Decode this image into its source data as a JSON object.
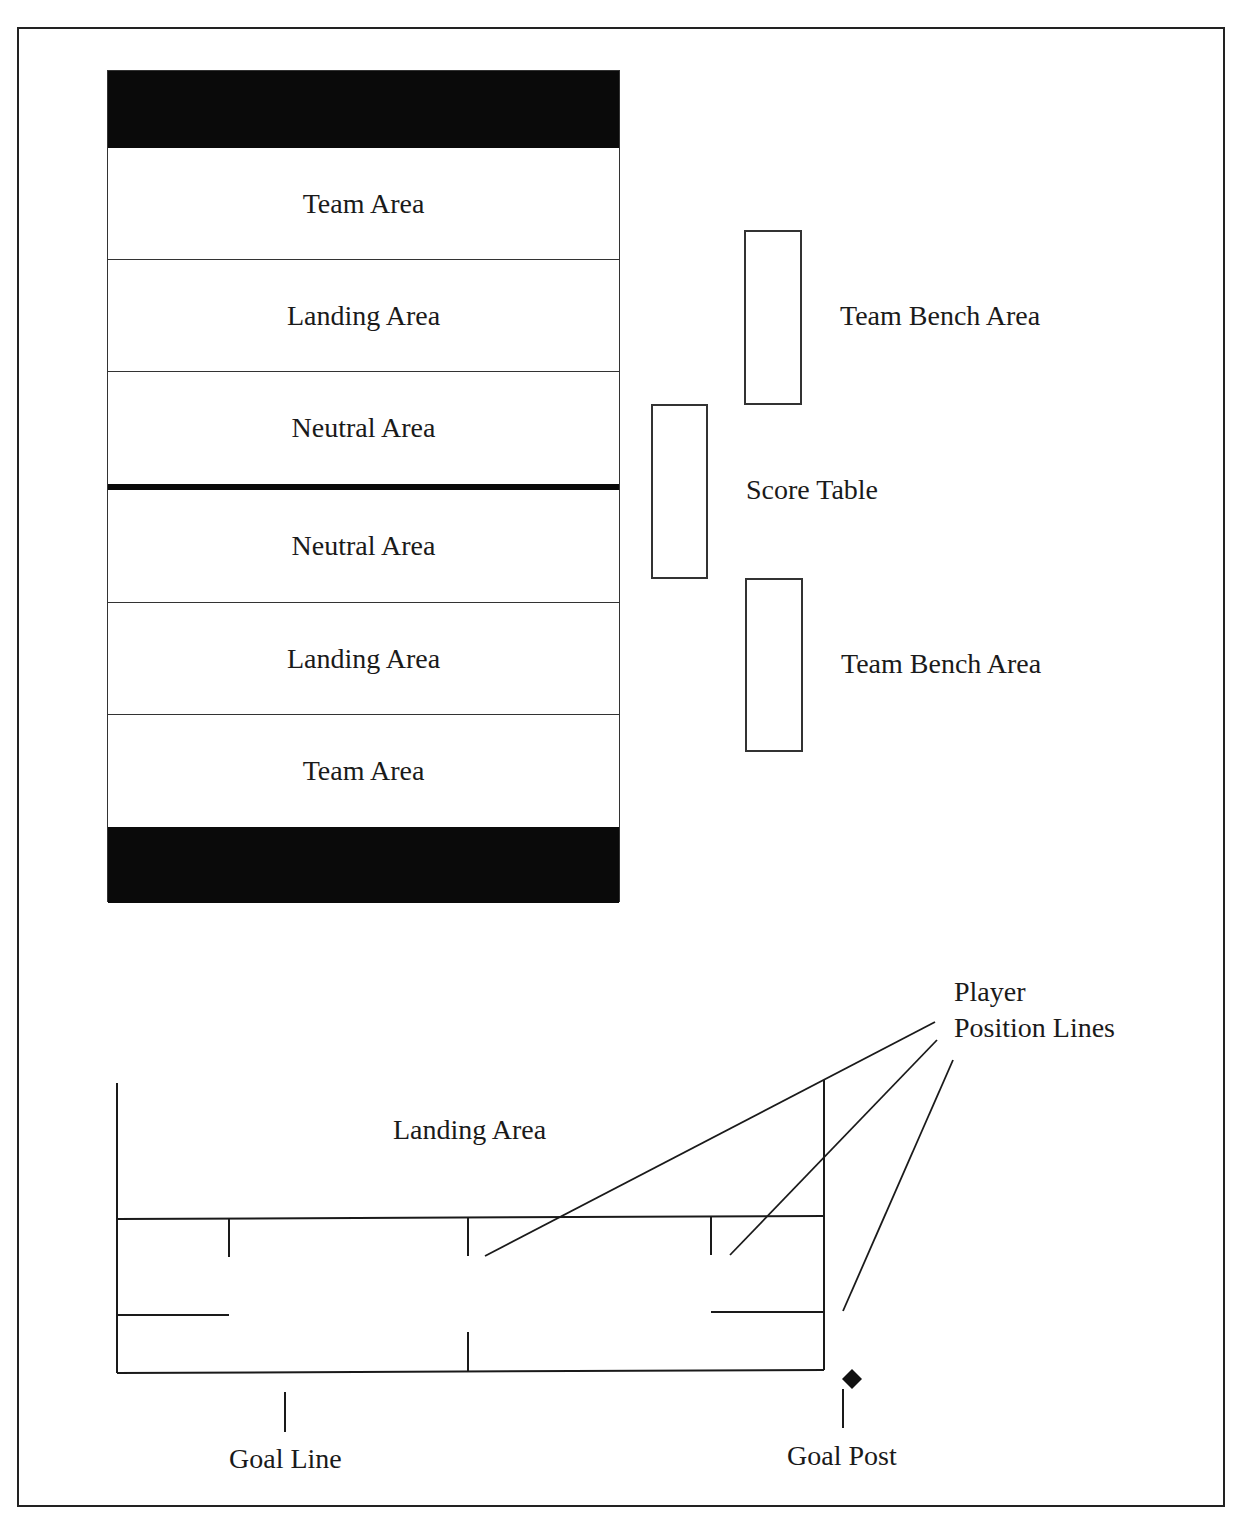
{
  "court": {
    "zones": [
      {
        "label": "Team Area"
      },
      {
        "label": "Landing Area"
      },
      {
        "label": "Neutral Area"
      },
      {
        "label": "Neutral Area"
      },
      {
        "label": "Landing Area"
      },
      {
        "label": "Team Area"
      }
    ]
  },
  "sideline": {
    "bench_top_label": "Team Bench Area",
    "score_table_label": "Score Table",
    "bench_bottom_label": "Team Bench Area"
  },
  "detail": {
    "landing_area_label": "Landing Area",
    "player_position_label_line1": "Player",
    "player_position_label_line2": "Position Lines",
    "goal_line_label": "Goal Line",
    "goal_post_label": "Goal Post"
  },
  "colors": {
    "line": "#1a1a1a",
    "fill_dark": "#0a0a0a",
    "background": "#ffffff"
  }
}
